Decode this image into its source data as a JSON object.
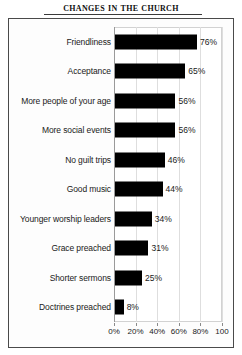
{
  "title": "Changes in the Church",
  "chart_data": {
    "type": "bar",
    "orientation": "horizontal",
    "title": "Changes in the Church",
    "xlabel": "",
    "ylabel": "",
    "xlim": [
      0,
      100
    ],
    "grid": true,
    "legend": false,
    "categories": [
      "Friendliness",
      "Acceptance",
      "More people of your age",
      "More social events",
      "No guilt trips",
      "Good music",
      "Younger worship leaders",
      "Grace preached",
      "Shorter sermons",
      "Doctrines preached"
    ],
    "values": [
      76,
      65,
      56,
      56,
      46,
      44,
      34,
      31,
      25,
      8
    ],
    "data_labels": [
      "76%",
      "65%",
      "56%",
      "56%",
      "46%",
      "44%",
      "34%",
      "31%",
      "25%",
      "8%"
    ],
    "x_ticks": [
      0,
      20,
      40,
      60,
      80,
      100
    ],
    "x_tick_labels": [
      "0%",
      "20%",
      "40%",
      "60%",
      "80%",
      "100"
    ],
    "bar_color": "#000000",
    "background_color": "#ffffff",
    "gridline_color": "#dedede"
  }
}
